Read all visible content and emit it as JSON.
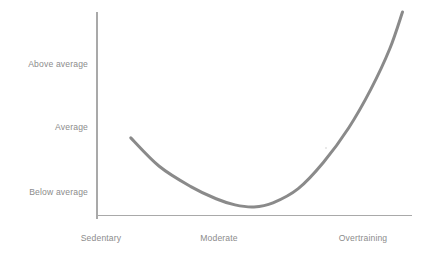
{
  "chart_data": {
    "type": "line",
    "title": "",
    "subtitle": "",
    "xlabel": "",
    "ylabel": "",
    "grid": false,
    "legend": false,
    "categories": [
      "Sedentary",
      "Moderate",
      "Overtraining"
    ],
    "x_tick_labels": [
      "Sedentary",
      "Moderate",
      "Overtraining"
    ],
    "y_tick_labels": [
      "Above average",
      "Average",
      "Below average"
    ],
    "y_tick_order_top_to_bottom": [
      "Above average",
      "Average",
      "Below average"
    ],
    "ylim": [
      "Below average",
      "Above average"
    ],
    "xlim": [
      "Sedentary",
      "Overtraining"
    ],
    "series": [
      {
        "name": "Illness risk",
        "shape": "u-curve",
        "values": [
          {
            "x": "Sedentary",
            "y": "Above average (slightly below)"
          },
          {
            "x": "Moderate",
            "y": "Below average"
          },
          {
            "x": "Overtraining",
            "y": "Above average (well above)"
          }
        ],
        "points": [
          {
            "x": 0.11,
            "y": 0.38
          },
          {
            "x": 0.2,
            "y": 0.24
          },
          {
            "x": 0.3,
            "y": 0.14
          },
          {
            "x": 0.38,
            "y": 0.08
          },
          {
            "x": 0.44,
            "y": 0.05
          },
          {
            "x": 0.5,
            "y": 0.04
          },
          {
            "x": 0.56,
            "y": 0.06
          },
          {
            "x": 0.64,
            "y": 0.13
          },
          {
            "x": 0.72,
            "y": 0.26
          },
          {
            "x": 0.8,
            "y": 0.43
          },
          {
            "x": 0.87,
            "y": 0.62
          },
          {
            "x": 0.93,
            "y": 0.82
          },
          {
            "x": 0.97,
            "y": 1.0
          }
        ],
        "color": "#8a8a8a",
        "line_width": 3
      }
    ],
    "colors": {
      "curve": "#8a8a8a",
      "axis": "#a9a9a9",
      "label_text": "#8c8c8c",
      "background": "#ffffff"
    }
  },
  "axes": {
    "y_labels": [
      {
        "label": "Above average"
      },
      {
        "label": "Average"
      },
      {
        "label": "Below average"
      }
    ],
    "x_labels": [
      {
        "label": "Sedentary"
      },
      {
        "label": "Moderate"
      },
      {
        "label": "Overtraining"
      }
    ]
  }
}
